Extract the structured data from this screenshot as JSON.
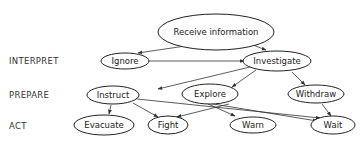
{
  "rows": [
    {
      "id": "interpret",
      "label": "INTERPRET"
    },
    {
      "id": "prepare",
      "label": "PREPARE"
    },
    {
      "id": "act",
      "label": "ACT"
    }
  ],
  "nodes": {
    "receive": {
      "label": "Receive information"
    },
    "ignore": {
      "label": "Ignore"
    },
    "investigate": {
      "label": "Investigate"
    },
    "instruct": {
      "label": "Instruct"
    },
    "explore": {
      "label": "Explore"
    },
    "withdraw": {
      "label": "Withdraw"
    },
    "evacuate": {
      "label": "Evacuate"
    },
    "fight": {
      "label": "Fight"
    },
    "warn": {
      "label": "Warn"
    },
    "wait": {
      "label": "Wait"
    }
  },
  "edges": [
    [
      "receive",
      "ignore"
    ],
    [
      "receive",
      "investigate"
    ],
    [
      "ignore",
      "investigate"
    ],
    [
      "investigate",
      "instruct"
    ],
    [
      "investigate",
      "explore"
    ],
    [
      "investigate",
      "withdraw"
    ],
    [
      "instruct",
      "evacuate"
    ],
    [
      "instruct",
      "fight"
    ],
    [
      "instruct",
      "wait"
    ],
    [
      "explore",
      "fight"
    ],
    [
      "explore",
      "warn"
    ],
    [
      "explore",
      "wait"
    ],
    [
      "withdraw",
      "wait"
    ]
  ]
}
